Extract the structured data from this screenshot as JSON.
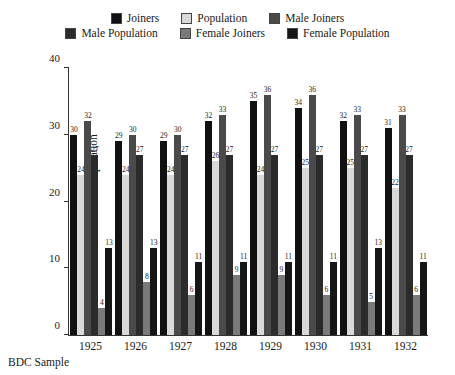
{
  "chart_data": {
    "type": "bar",
    "title": "",
    "xlabel": "",
    "ylabel": "Percent of Joiners/Population",
    "ylim": [
      0,
      40
    ],
    "yticks": [
      0,
      10,
      20,
      30,
      40
    ],
    "grid": false,
    "legend_position": "top",
    "categories": [
      "1925",
      "1926",
      "1927",
      "1928",
      "1929",
      "1930",
      "1931",
      "1932"
    ],
    "series": [
      {
        "name": "Joiners",
        "color": "#111111",
        "values": [
          30,
          29,
          29,
          32,
          35,
          34,
          32,
          31
        ]
      },
      {
        "name": "Population",
        "color": "#d9d9d9",
        "values": [
          24,
          24,
          24,
          26,
          24,
          25,
          25,
          22
        ]
      },
      {
        "name": "Male Joiners",
        "color": "#4a4a4a",
        "values": [
          32,
          30,
          30,
          33,
          36,
          36,
          33,
          33
        ]
      },
      {
        "name": "Male Population",
        "color": "#2b2b2b",
        "values": [
          27,
          27,
          27,
          27,
          27,
          27,
          27,
          27
        ]
      },
      {
        "name": "Female Joiners",
        "color": "#7a7a7a",
        "values": [
          4,
          8,
          6,
          9,
          9,
          6,
          5,
          6
        ]
      },
      {
        "name": "Female Population",
        "color": "#161616",
        "values": [
          13,
          13,
          11,
          11,
          11,
          11,
          13,
          11
        ]
      }
    ]
  },
  "caption": "BDC Sample"
}
